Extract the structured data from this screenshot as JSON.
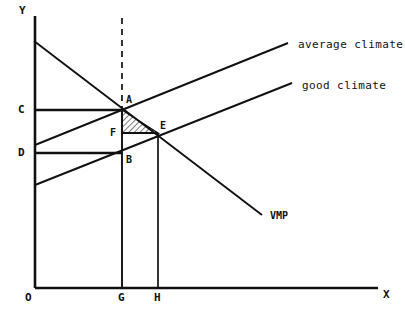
{
  "figure": {
    "background_color": "#ffffff",
    "ink_color": "#111111",
    "axes": {
      "y_label": "Y",
      "x_label": "X",
      "origin_label": "O",
      "y_axis": {
        "x": 35,
        "y_top": 16,
        "y_bottom": 288
      },
      "x_axis": {
        "y": 288,
        "x_left": 35,
        "x_right": 378
      }
    },
    "y_ticks": [
      {
        "label": "C",
        "y": 110
      },
      {
        "label": "D",
        "y": 153
      }
    ],
    "x_ticks": [
      {
        "label": "G",
        "x": 122
      },
      {
        "label": "H",
        "x": 158
      }
    ],
    "points": [
      {
        "label": "A",
        "x": 122,
        "y": 110
      },
      {
        "label": "B",
        "x": 122,
        "y": 153
      },
      {
        "label": "E",
        "x": 158,
        "y": 133
      },
      {
        "label": "F",
        "x": 122,
        "y": 133
      }
    ],
    "curves": [
      {
        "name": "average-climate",
        "label": "average climate",
        "x1": 35,
        "y1": 145,
        "x2": 288,
        "y2": 43,
        "label_x": 298,
        "label_y": 39
      },
      {
        "name": "good-climate",
        "label": "good climate",
        "x1": 35,
        "y1": 185,
        "x2": 292,
        "y2": 83,
        "label_x": 302,
        "label_y": 80
      },
      {
        "name": "vmp",
        "label": "VMP",
        "x1": 34,
        "y1": 41,
        "x2": 262,
        "y2": 215,
        "label_x": 270,
        "label_y": 215
      }
    ],
    "guide_lines": [
      {
        "name": "dashed-vertical-from-A",
        "x1": 122,
        "y1": 18,
        "x2": 122,
        "y2": 110,
        "style": "dashed"
      },
      {
        "name": "vertical-G-to-A",
        "x1": 122,
        "y1": 110,
        "x2": 122,
        "y2": 288,
        "style": "solid"
      },
      {
        "name": "vertical-H-to-E",
        "x1": 158,
        "y1": 133,
        "x2": 158,
        "y2": 288,
        "style": "solid"
      },
      {
        "name": "horizontal-C-to-A",
        "x1": 35,
        "y1": 110,
        "x2": 122,
        "y2": 110,
        "style": "solid"
      },
      {
        "name": "horizontal-D-to-B",
        "x1": 35,
        "y1": 153,
        "x2": 122,
        "y2": 153,
        "style": "solid"
      },
      {
        "name": "horizontal-F-to-E",
        "x1": 122,
        "y1": 133,
        "x2": 158,
        "y2": 133,
        "style": "solid"
      }
    ],
    "shaded_region": {
      "name": "triangle-AFE",
      "vertices": [
        [
          122,
          110
        ],
        [
          122,
          133
        ],
        [
          158,
          133
        ]
      ],
      "fill": "hatched",
      "hatch_color": "#111111"
    }
  }
}
